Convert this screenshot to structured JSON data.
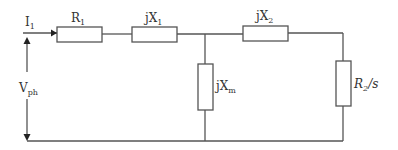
{
  "diagram": {
    "type": "equivalent-circuit",
    "colors": {
      "wire": "#555555",
      "text": "#333333",
      "background": "#ffffff"
    },
    "labels": {
      "current": {
        "main": "I",
        "sub": "1"
      },
      "voltage": {
        "main": "V",
        "sub": "ph"
      },
      "r1": {
        "main": "R",
        "sub": "1"
      },
      "x1": {
        "main": "jX",
        "sub": "1"
      },
      "x2": {
        "main": "jX",
        "sub": "2"
      },
      "xm": {
        "main": "jX",
        "sub": "m"
      },
      "r2s": {
        "main": "R",
        "sub": "2",
        "suffix": "/s"
      }
    },
    "components": [
      {
        "id": "R1",
        "orientation": "horizontal",
        "position": "series-top-left"
      },
      {
        "id": "jX1",
        "orientation": "horizontal",
        "position": "series-top-middle"
      },
      {
        "id": "jXm",
        "orientation": "vertical",
        "position": "shunt-middle"
      },
      {
        "id": "jX2",
        "orientation": "horizontal",
        "position": "series-top-right"
      },
      {
        "id": "R2/s",
        "orientation": "vertical",
        "position": "load-right"
      }
    ]
  }
}
